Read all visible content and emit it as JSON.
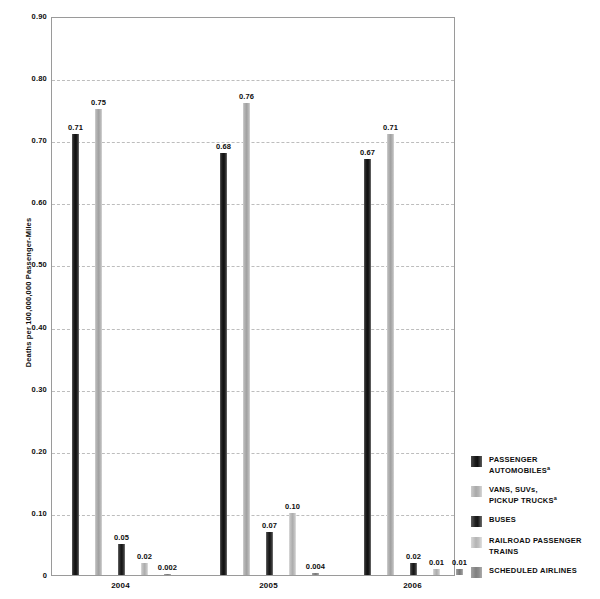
{
  "chart_data": {
    "type": "bar",
    "title": "",
    "subtitle": "",
    "xlabel": "",
    "ylabel": "Deaths per 100,000,000 Passenger-Miles",
    "categories": [
      "2004",
      "2005",
      "2006"
    ],
    "ylim": [
      0,
      0.9
    ],
    "ytick_labels": [
      "0.90",
      "0.80",
      "0.70",
      "0.60",
      "0.50",
      "0.40",
      "0.30",
      "0.20",
      "0.10",
      "0"
    ],
    "ytick_values": [
      0.9,
      0.8,
      0.7,
      0.6,
      0.5,
      0.4,
      0.3,
      0.2,
      0.1,
      0
    ],
    "grid": "horizontal-dashed",
    "legend_position": "right",
    "series": [
      {
        "name": "PASSENGER AUTOMOBILES",
        "footnote": "a",
        "color": "#141414",
        "values": [
          0.71,
          0.68,
          0.67
        ],
        "labels": [
          "0.71",
          "0.68",
          "0.67"
        ]
      },
      {
        "name": "VANS, SUVs, PICKUP TRUCKS",
        "footnote": "a",
        "color": "#ababab",
        "values": [
          0.75,
          0.76,
          0.71
        ],
        "labels": [
          "0.75",
          "0.76",
          "0.71"
        ]
      },
      {
        "name": "BUSES",
        "footnote": "",
        "color": "#1c1c1c",
        "values": [
          0.05,
          0.07,
          0.02
        ],
        "labels": [
          "0.05",
          "0.07",
          "0.02"
        ]
      },
      {
        "name": "RAILROAD PASSENGER TRAINS",
        "footnote": "",
        "color": "#bcbcbc",
        "values": [
          0.02,
          0.1,
          0.01
        ],
        "labels": [
          "0.02",
          "0.10",
          "0.01"
        ]
      },
      {
        "name": "SCHEDULED AIRLINES",
        "footnote": "",
        "color": "#858585",
        "values": [
          0.002,
          0.004,
          0.01
        ],
        "labels": [
          "0.002",
          "0.004",
          "0.01"
        ]
      }
    ]
  },
  "axis": {
    "ylabel": "Deaths per 100,000,000 Passenger-Miles",
    "yticks": [
      "0.90",
      "0.80",
      "0.70",
      "0.60",
      "0.50",
      "0.40",
      "0.30",
      "0.20",
      "0.10",
      "0"
    ],
    "xticks": [
      "2004",
      "2005",
      "2006"
    ]
  },
  "legend": {
    "items": [
      {
        "label_line1": "PASSENGER",
        "label_line2": "AUTOMOBILES",
        "sup": "a"
      },
      {
        "label_line1": "VANS, SUVs,",
        "label_line2": "PICKUP TRUCKS",
        "sup": "a"
      },
      {
        "label_line1": "BUSES",
        "label_line2": "",
        "sup": ""
      },
      {
        "label_line1": "RAILROAD PASSENGER",
        "label_line2": "TRAINS",
        "sup": ""
      },
      {
        "label_line1": "SCHEDULED AIRLINES",
        "label_line2": "",
        "sup": ""
      }
    ]
  }
}
